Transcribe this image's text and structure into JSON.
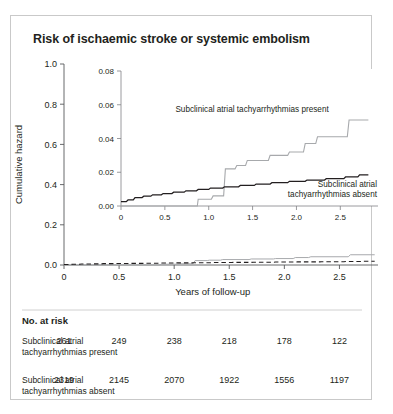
{
  "figure": {
    "title": "Risk of ischaemic stroke or systemic embolism"
  },
  "chart_data": {
    "type": "line",
    "title": "Risk of ischaemic stroke or systemic embolism",
    "xlabel": "Years of follow-up",
    "ylabel": "Cumulative hazard",
    "xlim": [
      0,
      2.85
    ],
    "ylim": [
      0,
      1.0
    ],
    "xticks": [
      "0",
      "0.5",
      "1.0",
      "1.5",
      "2.0",
      "2.5"
    ],
    "xtick_values": [
      0,
      0.5,
      1.0,
      1.5,
      2.0,
      2.5
    ],
    "yticks": [
      "0.0",
      "0.2",
      "0.4",
      "0.6",
      "0.8",
      "1.0"
    ],
    "ytick_values": [
      0.0,
      0.2,
      0.4,
      0.6,
      0.8,
      1.0
    ],
    "grid": false,
    "legend_position": "inline-annotation",
    "series": [
      {
        "name": "Subclinical atrial tachyarrhythmias present",
        "style": "step-solid-gray",
        "color": "#a7a9ac",
        "x": [
          0,
          0.87,
          0.88,
          1.03,
          1.05,
          1.17,
          1.19,
          1.3,
          1.32,
          1.42,
          1.44,
          1.68,
          1.7,
          1.9,
          1.92,
          2.08,
          2.1,
          2.22,
          2.24,
          2.58,
          2.6,
          2.82
        ],
        "y": [
          0,
          0,
          0.004,
          0.004,
          0.006,
          0.006,
          0.022,
          0.022,
          0.024,
          0.024,
          0.027,
          0.027,
          0.03,
          0.03,
          0.032,
          0.032,
          0.037,
          0.037,
          0.041,
          0.041,
          0.051,
          0.051
        ],
        "final_value": 0.051
      },
      {
        "name": "Subclinical atrial tachyarrhythmias absent",
        "style": "step-solid-black",
        "color": "#231f20",
        "x": [
          0,
          0.06,
          0.08,
          0.14,
          0.16,
          0.24,
          0.26,
          0.34,
          0.36,
          0.46,
          0.48,
          0.58,
          0.6,
          0.72,
          0.74,
          0.86,
          0.88,
          1.0,
          1.02,
          1.16,
          1.18,
          1.34,
          1.36,
          1.52,
          1.54,
          1.7,
          1.72,
          1.9,
          1.92,
          2.1,
          2.12,
          2.32,
          2.34,
          2.54,
          2.56,
          2.7,
          2.72,
          2.82
        ],
        "y": [
          0.0026,
          0.0026,
          0.0036,
          0.0036,
          0.005,
          0.005,
          0.0058,
          0.0058,
          0.0066,
          0.0066,
          0.0074,
          0.0074,
          0.0082,
          0.0082,
          0.009,
          0.009,
          0.0098,
          0.0098,
          0.0106,
          0.0106,
          0.0114,
          0.0114,
          0.0122,
          0.0122,
          0.013,
          0.013,
          0.0138,
          0.0138,
          0.0146,
          0.0146,
          0.0154,
          0.0154,
          0.0162,
          0.0162,
          0.0172,
          0.0172,
          0.0185,
          0.0185
        ],
        "final_value": 0.0185
      }
    ],
    "inset": {
      "ylim": [
        0,
        0.08
      ],
      "xlim": [
        0,
        2.85
      ],
      "yticks": [
        "0.00",
        "0.02",
        "0.04",
        "0.06",
        "0.08"
      ],
      "ytick_values": [
        0.0,
        0.02,
        0.04,
        0.06,
        0.08
      ],
      "xticks": [
        "0",
        "0.5",
        "1.0",
        "1.5",
        "2.0",
        "2.5"
      ],
      "xtick_values": [
        0,
        0.5,
        1.0,
        1.5,
        2.0,
        2.5
      ],
      "annotations": [
        "Subclinical atrial tachyarrhythmias present",
        "Subclinical atrial",
        "tachyarrhythmias absent"
      ]
    }
  },
  "risk_table": {
    "header": "No. at risk",
    "rows": [
      {
        "label_line1": "Subclinical atrial",
        "label_line2": "tachyarrhythmias present",
        "values": [
          "261",
          "249",
          "238",
          "218",
          "178",
          "122"
        ]
      },
      {
        "label_line1": "Subclinical atrial",
        "label_line2": "tachyarrhythmias absent",
        "values": [
          "2319",
          "2145",
          "2070",
          "1922",
          "1556",
          "1197"
        ]
      }
    ]
  },
  "colors": {
    "present": "#a7a9ac",
    "absent": "#231f20",
    "axis": "#58595b",
    "border": "#c9c9c9"
  }
}
